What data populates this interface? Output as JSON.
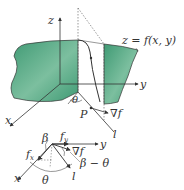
{
  "diagram": {
    "colors": {
      "surface": "#3f9a74",
      "surface_light": "#bfe0cf",
      "line": "#333333",
      "background": "#ffffff"
    },
    "upper": {
      "axis_z": "z",
      "axis_y": "y",
      "axis_x": "x",
      "surface_label": "z = f(x, y)",
      "angle_label": "θ",
      "point_label": "P",
      "gradient_label": "∇f",
      "direction_label": "l"
    },
    "lower": {
      "axis_y": "y",
      "axis_x": "x",
      "fy_label": "f",
      "fy_sub": "y",
      "fx_label": "f",
      "fx_sub": "x",
      "beta_label": "β",
      "gradient_label": "∇f",
      "beta_minus_theta_label": "β − θ",
      "theta_label": "θ",
      "direction_label": "l"
    }
  }
}
